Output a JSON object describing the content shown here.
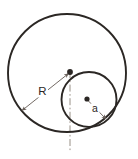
{
  "figure": {
    "background_color": "#ffffff",
    "stroke_color": "#2b2724",
    "thin_stroke_color": "#6b625c",
    "width": 138,
    "height": 159
  },
  "shapes": {
    "large_circle": {
      "name": "large-circle",
      "center_x": 67,
      "center_y": 73,
      "radius": 59,
      "stroke_width": 1.9
    },
    "small_circle": {
      "name": "small-circle",
      "center_x": 89,
      "center_y": 99.5,
      "radius": 27.5,
      "stroke_width": 1.9
    },
    "center_line": {
      "name": "vertical-centerline",
      "x": 70,
      "y_top": 71,
      "y_bottom": 152,
      "dash_pattern": "7,2.5,1.6,2.5"
    }
  },
  "markers": {
    "large_circle_center": {
      "label": "large-circle-center-dot",
      "x": 70,
      "y": 72,
      "r": 2.9
    },
    "small_circle_center": {
      "label": "small-circle-center-dot",
      "x": 87,
      "y": 99,
      "r": 2.6
    }
  },
  "dimensions": [
    {
      "id": "radius-R",
      "label": "R",
      "label_x": 42,
      "label_y": 95,
      "from_x": 68.5,
      "from_y": 73.5,
      "to_x": 22,
      "to_y": 110.5,
      "double_headed": true
    },
    {
      "id": "radius-a",
      "label": "a",
      "label_x": 94.5,
      "label_y": 112,
      "from_x": 87.5,
      "from_y": 100,
      "to_x": 106,
      "to_y": 119,
      "double_headed": false
    }
  ],
  "annotations": {
    "radius_large_label": "R",
    "radius_small_label": "a"
  }
}
